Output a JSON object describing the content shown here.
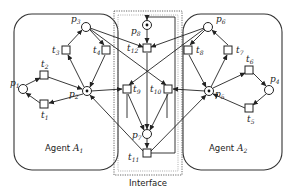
{
  "diagram": {
    "type": "petri-net",
    "regions": [
      {
        "id": "agent1",
        "label": "Agent",
        "label_sub": "A",
        "label_idx": "1"
      },
      {
        "id": "interface",
        "label": "Interface"
      },
      {
        "id": "agent2",
        "label": "Agent",
        "label_sub": "A",
        "label_idx": "2"
      }
    ],
    "places": [
      {
        "id": "p1",
        "name": "p",
        "idx": "1",
        "token": false
      },
      {
        "id": "p2",
        "name": "p",
        "idx": "2",
        "token": true
      },
      {
        "id": "p3",
        "name": "p",
        "idx": "3",
        "token": false
      },
      {
        "id": "p4",
        "name": "p",
        "idx": "4",
        "token": false
      },
      {
        "id": "p5",
        "name": "p",
        "idx": "5",
        "token": true
      },
      {
        "id": "p6",
        "name": "p",
        "idx": "6",
        "token": false
      },
      {
        "id": "p7",
        "name": "p",
        "idx": "7",
        "token": false
      },
      {
        "id": "p8",
        "name": "p",
        "idx": "8",
        "token": true
      }
    ],
    "transitions": [
      {
        "id": "t1",
        "name": "t",
        "idx": "1"
      },
      {
        "id": "t2",
        "name": "t",
        "idx": "2"
      },
      {
        "id": "t3",
        "name": "t",
        "idx": "3"
      },
      {
        "id": "t4",
        "name": "t",
        "idx": "4"
      },
      {
        "id": "t5",
        "name": "t",
        "idx": "5"
      },
      {
        "id": "t6",
        "name": "t",
        "idx": "6"
      },
      {
        "id": "t7",
        "name": "t",
        "idx": "7"
      },
      {
        "id": "t8",
        "name": "t",
        "idx": "8"
      },
      {
        "id": "t9",
        "name": "t",
        "idx": "9"
      },
      {
        "id": "t10",
        "name": "t",
        "idx": "10"
      },
      {
        "id": "t11",
        "name": "t",
        "idx": "11"
      },
      {
        "id": "t12",
        "name": "t",
        "idx": "12"
      }
    ],
    "arcs": [
      [
        "p1",
        "t2"
      ],
      [
        "t2",
        "p2"
      ],
      [
        "p2",
        "t1"
      ],
      [
        "t1",
        "p1"
      ],
      [
        "p2",
        "t3"
      ],
      [
        "t3",
        "p3"
      ],
      [
        "p3",
        "t4"
      ],
      [
        "t4",
        "p2"
      ],
      [
        "p4",
        "t5"
      ],
      [
        "t5",
        "p5"
      ],
      [
        "p5",
        "t6"
      ],
      [
        "t6",
        "p4"
      ],
      [
        "p5",
        "t7"
      ],
      [
        "t7",
        "p6"
      ],
      [
        "p6",
        "t8"
      ],
      [
        "t8",
        "p5"
      ],
      [
        "p3",
        "t12"
      ],
      [
        "p6",
        "t12"
      ],
      [
        "p8",
        "t12"
      ],
      [
        "p3",
        "t10"
      ],
      [
        "p6",
        "t9"
      ],
      [
        "p2",
        "t9"
      ],
      [
        "p5",
        "t10"
      ],
      [
        "t9",
        "p7"
      ],
      [
        "t10",
        "p7"
      ],
      [
        "t12",
        "p7"
      ],
      [
        "p7",
        "t11"
      ],
      [
        "t11",
        "p2"
      ],
      [
        "t11",
        "p5"
      ],
      [
        "t11",
        "p8"
      ]
    ]
  }
}
